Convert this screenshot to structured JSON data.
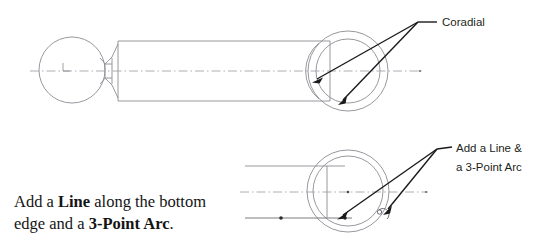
{
  "canvas": {
    "width": 537,
    "height": 246,
    "background": "#ffffff"
  },
  "colors": {
    "geometry_line": "#8c8c93",
    "geometry_line_dark": "#6e6e75",
    "centerline": "#9a9aa2",
    "leader_line": "#1a1a1a",
    "text_sans": "#231f20",
    "text_serif": "#141414",
    "point_marker": "#2b2b2b"
  },
  "annotations": {
    "top_callout": {
      "text": "Coradial",
      "x": 424,
      "y": 26,
      "leader_junction_x": 418,
      "leader_junction_y": 22,
      "arrow_targets": [
        {
          "x": 313,
          "y": 82,
          "name": "left-arc-endpoint"
        },
        {
          "x": 339,
          "y": 103,
          "name": "inner-circle-lower-arc"
        }
      ]
    },
    "bottom_callout": {
      "line1": "Add a Line &",
      "line2": "a 3-Point Arc",
      "x": 443,
      "y1": 152,
      "y2": 170,
      "leader_junction_x": 437,
      "leader_junction_y": 149,
      "arrow_targets": [
        {
          "x": 338,
          "y": 218,
          "name": "bottom-edge-line"
        },
        {
          "x": 384,
          "y": 215,
          "name": "three-point-arc"
        }
      ]
    },
    "instruction": {
      "line1_prefix": "Add a ",
      "line1_bold": "Line",
      "line1_suffix": " along the bottom",
      "line2_prefix": "edge and a ",
      "line2_bold": "3-Point Arc",
      "line2_suffix": ".",
      "x": 14,
      "y1": 206,
      "y2": 228
    }
  },
  "top_view": {
    "name": "ball-handle-shaft-assembly",
    "ball": {
      "cx": 72,
      "cy": 70,
      "r": 33
    },
    "neck": {
      "x_start": 100,
      "x_end": 118,
      "waist_half_height": 7,
      "flange_half_height": 13
    },
    "shaft": {
      "x_start": 118,
      "x_end": 330,
      "top_y": 41,
      "bottom_y": 101
    },
    "centerline": {
      "y": 71,
      "x_start": 30,
      "x_end": 422
    },
    "outer_circle": {
      "cx": 348,
      "cy": 71,
      "r": 40
    },
    "inner_circle": {
      "cx": 348,
      "cy": 71,
      "r": 32
    },
    "end_arc": {
      "cx": 348,
      "cy": 71,
      "r": 36
    },
    "axis_marker": {
      "x": 63,
      "y": 71
    }
  },
  "bottom_view": {
    "name": "bore-end-detail",
    "outer_circle": {
      "cx": 348,
      "cy": 191,
      "r": 41
    },
    "inner_circle": {
      "cx": 348,
      "cy": 191,
      "r": 35
    },
    "top_edge_line": {
      "y": 166,
      "x_start": 245,
      "x_end": 345
    },
    "bottom_edge_line": {
      "y": 218,
      "x_start": 245,
      "x_end": 352
    },
    "vertical_line": {
      "x": 327,
      "y_top": 166,
      "y_bottom": 218
    },
    "centerline": {
      "y": 192,
      "x_start": 240,
      "x_end": 428
    },
    "point_markers": [
      {
        "x": 281,
        "y": 218
      },
      {
        "x": 345,
        "y": 218
      }
    ],
    "three_point_arc": {
      "cx": 383,
      "cy": 214,
      "r": 5
    }
  }
}
